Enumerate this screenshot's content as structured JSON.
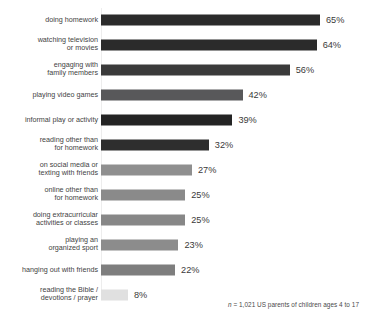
{
  "chart_data": {
    "type": "bar",
    "orientation": "horizontal",
    "title": "",
    "xlabel": "",
    "ylabel": "",
    "xlim": [
      0,
      65
    ],
    "grid": false,
    "legend": null,
    "value_suffix": "%",
    "categories": [
      "doing homework",
      "watching television\nor movies",
      "engaging with\nfamily members",
      "playing video games",
      "informal play or activity",
      "reading other than\nfor homework",
      "on social media or\ntexting with friends",
      "online other than\nfor homework",
      "doing extracurricular\nactivities or classes",
      "playing an\norganized sport",
      "hanging out with friends",
      "reading the Bible /\ndevotions / prayer"
    ],
    "values": [
      65,
      64,
      56,
      42,
      39,
      32,
      27,
      25,
      25,
      23,
      22,
      8
    ],
    "value_labels": [
      "65%",
      "64%",
      "56%",
      "42%",
      "39%",
      "32%",
      "27%",
      "25%",
      "25%",
      "23%",
      "22%",
      "8%"
    ],
    "bar_colors": [
      "#2b2b2b",
      "#2b2b2b",
      "#3a3a3a",
      "#58585a",
      "#242424",
      "#2e2e2e",
      "#8f8f8f",
      "#8a8a8a",
      "#878787",
      "#8c8c8c",
      "#7e7e7e",
      "#e0e0e0"
    ],
    "annotations": [
      "n = 1,021 US parents of children ages 4 to 17"
    ]
  },
  "footnote": {
    "prefix": "n",
    "text": " = 1,021 US parents of children ages 4 to 17"
  },
  "colors": {
    "axis_line": "#ededed",
    "label_text": "#3f3f3f",
    "value_text": "#3a3a3a",
    "background": "#ffffff"
  }
}
